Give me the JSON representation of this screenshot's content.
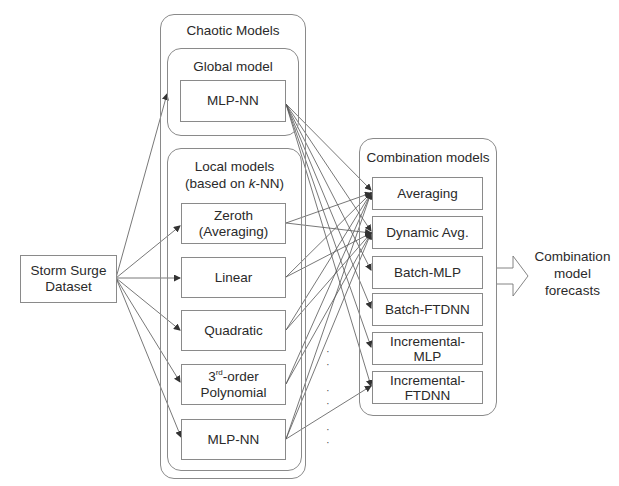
{
  "input": {
    "label_line1": "Storm Surge",
    "label_line2": "Dataset"
  },
  "chaotic": {
    "title": "Chaotic Models",
    "global": {
      "title": "Global model",
      "model": "MLP-NN"
    },
    "local": {
      "title_line1": "Local models",
      "title_line2_pre": "(based on ",
      "title_line2_k": "k",
      "title_line2_post": "-NN)",
      "models": [
        {
          "line1": "Zeroth",
          "line2": "(Averaging)"
        },
        {
          "line1": "Linear"
        },
        {
          "line1": "Quadratic"
        },
        {
          "line1_num": "3",
          "line1_sup": "rd",
          "line1_rest": "-order",
          "line2": "Polynomial"
        },
        {
          "line1": "MLP-NN"
        }
      ]
    }
  },
  "ellipsis": "· · ·",
  "combination": {
    "title": "Combination models",
    "models": [
      {
        "line1": "Averaging"
      },
      {
        "line1": "Dynamic Avg."
      },
      {
        "line1": "Batch-MLP"
      },
      {
        "line1": "Batch-FTDNN"
      },
      {
        "line1": "Incremental-",
        "line2": "MLP"
      },
      {
        "line1": "Incremental-",
        "line2": "FTDNN"
      }
    ]
  },
  "output": {
    "line1": "Combination",
    "line2": "model",
    "line3": "forecasts"
  },
  "colors": {
    "line": "#555555",
    "border": "#8a8a8a"
  }
}
